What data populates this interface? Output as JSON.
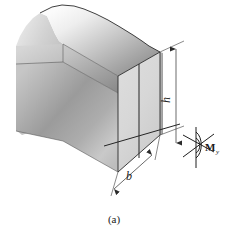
{
  "figure": {
    "caption": "(a)",
    "labels": {
      "height_dimension": "h",
      "width_dimension": "b",
      "moment_symbol": "M",
      "moment_subscript": "y"
    },
    "icons": {
      "moment_vector": "double-arc-moment-arrow-icon",
      "dimension_arrow": "dimension-arrowhead-icon"
    },
    "colors": {
      "background": "#ffffff",
      "front_face": "#d9d9d9",
      "top_face_light": "#f2f2f2",
      "top_face_dark": "#8f8f8f",
      "inner_face_light": "#e8e8e8",
      "inner_face_dark": "#787878",
      "side_face_light": "#e2e2e2",
      "side_face_dark": "#949494",
      "line": "#2b2b2b",
      "text": "#1a1a1a"
    }
  }
}
